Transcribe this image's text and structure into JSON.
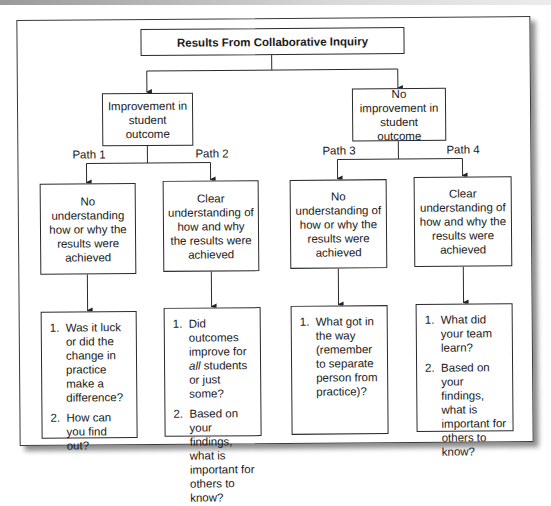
{
  "diagram": {
    "title": "Results From Collaborative Inquiry",
    "branches": [
      {
        "label": "Improvement in student outcome",
        "paths": [
          {
            "path_label": "Path 1",
            "understanding": "No understanding how or why the results were achieved",
            "questions": [
              {
                "num": "1.",
                "text": "Was it luck or did the change in practice make a difference?"
              },
              {
                "num": "2.",
                "text": "How can you find out?"
              }
            ]
          },
          {
            "path_label": "Path 2",
            "understanding": "Clear understanding of how and why the results were achieved",
            "questions": [
              {
                "num": "1.",
                "pre": "Did outcomes improve for ",
                "em": "all",
                "post": " students or just some?"
              },
              {
                "num": "2.",
                "text": "Based on your findings, what is important for others to know?"
              }
            ]
          }
        ]
      },
      {
        "label": "No improvement in student outcome",
        "paths": [
          {
            "path_label": "Path 3",
            "understanding": "No understanding of how or why the results were achieved",
            "questions": [
              {
                "num": "1.",
                "text": "What got in the way (remember to separate person from practice)?"
              }
            ]
          },
          {
            "path_label": "Path 4",
            "understanding": "Clear understanding of how and why the results were achieved",
            "questions": [
              {
                "num": "1.",
                "text": "What did your team learn?"
              },
              {
                "num": "2.",
                "text": "Based on your findings, what is important for others to know?"
              }
            ]
          }
        ]
      }
    ]
  }
}
